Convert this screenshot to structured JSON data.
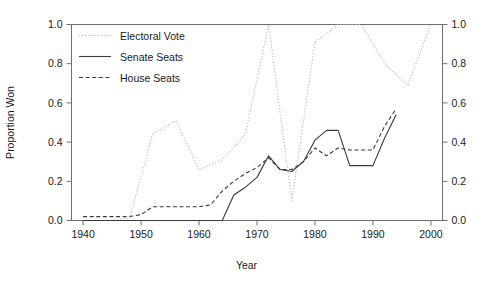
{
  "chart_data": {
    "type": "line",
    "title": "",
    "xlabel": "Year",
    "ylabel": "Proportion Won",
    "xlim": [
      1938,
      2002
    ],
    "ylim": [
      0.0,
      1.0
    ],
    "grid": false,
    "legend_position": "top-left",
    "dual_y_axis": true,
    "x_ticks": [
      1940,
      1950,
      1960,
      1970,
      1980,
      1990,
      2000
    ],
    "x_tick_labels": [
      "1940",
      "1950",
      "1960",
      "1970",
      "1980",
      "1990",
      "2000"
    ],
    "y_ticks": [
      0.0,
      0.2,
      0.4,
      0.6,
      0.8,
      1.0
    ],
    "y_tick_labels": [
      "0.0",
      "0.2",
      "0.4",
      "0.6",
      "0.8",
      "1.0"
    ],
    "y_ticks_right": [
      0.0,
      0.2,
      0.4,
      0.6,
      0.8,
      1.0
    ],
    "y_tick_labels_right": [
      "0.0",
      "0.2",
      "0.4",
      "0.6",
      "0.8",
      "1.0"
    ],
    "series": [
      {
        "name": "Electoral Vote",
        "style": "dotted",
        "color": "#b9b9b9",
        "x": [
          1940,
          1944,
          1948,
          1952,
          1956,
          1960,
          1964,
          1968,
          1972,
          1976,
          1980,
          1984,
          1988,
          1992,
          1996,
          2000
        ],
        "values": [
          0.0,
          0.0,
          0.01,
          0.44,
          0.51,
          0.26,
          0.31,
          0.44,
          1.0,
          0.1,
          0.91,
          1.0,
          1.0,
          0.8,
          0.69,
          1.0
        ]
      },
      {
        "name": "Senate Seats",
        "style": "solid",
        "color": "#3a3a3a",
        "x": [
          1940,
          1942,
          1944,
          1946,
          1948,
          1950,
          1952,
          1954,
          1956,
          1958,
          1960,
          1962,
          1964,
          1966,
          1968,
          1970,
          1972,
          1974,
          1976,
          1978,
          1980,
          1982,
          1984,
          1986,
          1988,
          1990,
          1992,
          1994
        ],
        "values": [
          0.0,
          0.0,
          0.0,
          0.0,
          0.0,
          0.0,
          0.0,
          0.0,
          0.0,
          0.0,
          0.0,
          0.0,
          0.0,
          0.13,
          0.17,
          0.22,
          0.33,
          0.26,
          0.25,
          0.3,
          0.41,
          0.46,
          0.46,
          0.28,
          0.28,
          0.28,
          0.42,
          0.54
        ]
      },
      {
        "name": "House Seats",
        "style": "dashed",
        "color": "#3a3a3a",
        "x": [
          1940,
          1942,
          1944,
          1946,
          1948,
          1950,
          1952,
          1954,
          1956,
          1958,
          1960,
          1962,
          1964,
          1966,
          1968,
          1970,
          1972,
          1974,
          1976,
          1978,
          1980,
          1982,
          1984,
          1986,
          1988,
          1990,
          1992,
          1994
        ],
        "values": [
          0.02,
          0.02,
          0.02,
          0.02,
          0.02,
          0.03,
          0.07,
          0.07,
          0.07,
          0.07,
          0.07,
          0.08,
          0.15,
          0.2,
          0.24,
          0.27,
          0.32,
          0.26,
          0.26,
          0.3,
          0.37,
          0.33,
          0.37,
          0.36,
          0.36,
          0.36,
          0.48,
          0.57
        ]
      }
    ]
  },
  "legend": {
    "items": [
      {
        "label": "Electoral Vote"
      },
      {
        "label": "Senate Seats"
      },
      {
        "label": "House Seats"
      }
    ]
  }
}
